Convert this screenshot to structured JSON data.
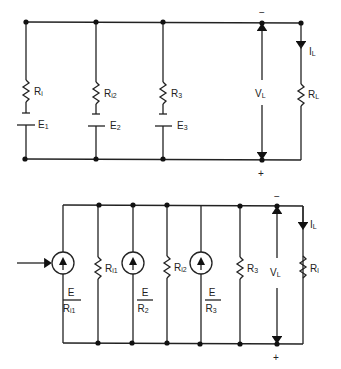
{
  "diagram": {
    "type": "circuit-schematic",
    "colors": {
      "wire": "#222222",
      "background": "#ffffff"
    }
  },
  "top_circuit": {
    "branches": [
      {
        "resistor": "R",
        "resistor_sub": "i",
        "source": "E",
        "source_sub": "1"
      },
      {
        "resistor": "R",
        "resistor_sub": "i2",
        "source": "E",
        "source_sub": "2"
      },
      {
        "resistor": "R",
        "resistor_sub": "3",
        "source": "E",
        "source_sub": "3"
      }
    ],
    "voltage": {
      "label": "V",
      "sub": "L",
      "minus": "−",
      "plus": "+"
    },
    "load": {
      "current": "I",
      "current_sub": "L",
      "resistor": "R",
      "resistor_sub": "L"
    }
  },
  "bottom_circuit": {
    "sources": [
      {
        "num": "E",
        "den": "R",
        "den_sub": "i1"
      },
      {
        "num": "E",
        "den": "R",
        "den_sub": "2"
      },
      {
        "num": "E",
        "den": "R",
        "den_sub": "3"
      }
    ],
    "resistors": [
      {
        "label": "R",
        "sub": "i1"
      },
      {
        "label": "R",
        "sub": "i2"
      },
      {
        "label": "R",
        "sub": "3"
      }
    ],
    "voltage": {
      "label": "V",
      "sub": "L",
      "minus": "−",
      "plus": "+"
    },
    "load": {
      "current": "I",
      "current_sub": "L",
      "resistor": "R",
      "resistor_sub": "l"
    },
    "arrow_pointer": "→"
  }
}
